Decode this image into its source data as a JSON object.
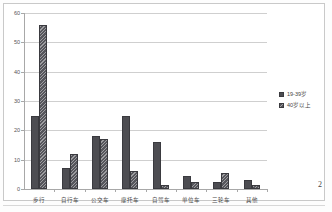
{
  "page": {
    "page_number": "2"
  },
  "legend": {
    "position": "right",
    "items": [
      {
        "label": "19-39岁",
        "swatch": "series-a-swatch"
      },
      {
        "label": "40岁以上",
        "swatch": "series-b-swatch"
      }
    ]
  },
  "chart_data": {
    "type": "bar",
    "title": "",
    "subtitle": "",
    "xlabel": "",
    "ylabel": "",
    "ylim": [
      0,
      60
    ],
    "yticks": [
      0,
      10,
      20,
      30,
      40,
      50,
      60
    ],
    "ytick_labels": [
      "0",
      "10",
      "20",
      "30",
      "40",
      "50",
      "60"
    ],
    "grid": true,
    "legend_position": "right",
    "categories": [
      "步行",
      "自行车",
      "公交车",
      "摩托车",
      "自驾车",
      "单位车",
      "三轮车",
      "其他"
    ],
    "series": [
      {
        "name": "19-39岁",
        "color": "#4d4d52",
        "fill": "solid",
        "values": [
          25,
          7,
          18,
          25,
          16,
          4.3,
          2.3,
          3.2
        ]
      },
      {
        "name": "40岁以上",
        "color": "#56565c",
        "fill": "diagonal-hatch",
        "values": [
          56,
          12,
          17,
          6,
          1.2,
          2.4,
          5.3,
          1.3
        ]
      }
    ]
  }
}
